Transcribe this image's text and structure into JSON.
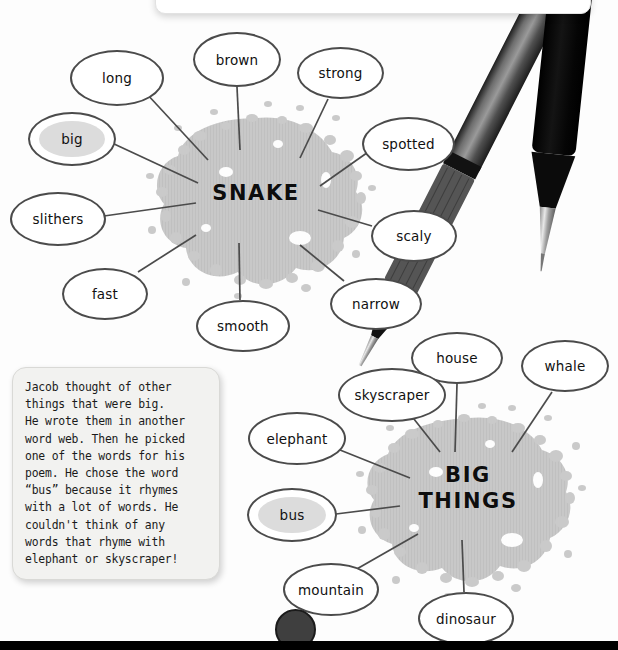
{
  "page": {
    "background_color": "#fdfdfd"
  },
  "top_panel": {
    "name": "cut-off-panel",
    "color": "#ffffff"
  },
  "colors": {
    "bubble_stroke": "#4b4b4b",
    "bubble_fill": "#ffffff",
    "highlight_fill": "#dcdcdc",
    "splatter_gray": "#c3c3c3",
    "splatter_light": "#d4d4d4",
    "connector": "#4b4b4b",
    "note_fill": "#f2f2f0",
    "bar_black": "#000000",
    "knob_gray": "#3f3f3f",
    "pen_dark": "#2b2b2b",
    "pen_black": "#0a0a0a"
  },
  "webs": [
    {
      "id": "snake-web",
      "center_label": "SNAKE",
      "center": {
        "x": 256,
        "y": 197
      },
      "nodes": [
        {
          "id": "long",
          "label": "long",
          "x": 70,
          "y": 50,
          "w": 94,
          "h": 56,
          "highlight": false
        },
        {
          "id": "brown",
          "label": "brown",
          "x": 193,
          "y": 32,
          "w": 88,
          "h": 55,
          "highlight": false
        },
        {
          "id": "strong",
          "label": "strong",
          "x": 297,
          "y": 47,
          "w": 87,
          "h": 52,
          "highlight": false
        },
        {
          "id": "spotted",
          "label": "spotted",
          "x": 362,
          "y": 117,
          "w": 93,
          "h": 54,
          "highlight": false
        },
        {
          "id": "scaly",
          "label": "scaly",
          "x": 371,
          "y": 210,
          "w": 86,
          "h": 52,
          "highlight": false
        },
        {
          "id": "narrow",
          "label": "narrow",
          "x": 330,
          "y": 278,
          "w": 92,
          "h": 52,
          "highlight": false
        },
        {
          "id": "smooth",
          "label": "smooth",
          "x": 196,
          "y": 300,
          "w": 94,
          "h": 52,
          "highlight": false
        },
        {
          "id": "fast",
          "label": "fast",
          "x": 62,
          "y": 268,
          "w": 86,
          "h": 52,
          "highlight": false
        },
        {
          "id": "slithers",
          "label": "slithers",
          "x": 10,
          "y": 192,
          "w": 96,
          "h": 54,
          "highlight": false
        },
        {
          "id": "big",
          "label": "big",
          "x": 28,
          "y": 112,
          "w": 88,
          "h": 54,
          "highlight": true
        }
      ]
    },
    {
      "id": "big-things-web",
      "center_label_line1": "BIG",
      "center_label_line2": "THINGS",
      "center": {
        "x": 468,
        "y": 491
      },
      "nodes": [
        {
          "id": "house",
          "label": "house",
          "x": 411,
          "y": 332,
          "w": 92,
          "h": 52,
          "highlight": false
        },
        {
          "id": "whale",
          "label": "whale",
          "x": 521,
          "y": 340,
          "w": 88,
          "h": 52,
          "highlight": false
        },
        {
          "id": "skyscraper",
          "label": "skyscraper",
          "x": 338,
          "y": 368,
          "w": 108,
          "h": 54,
          "highlight": false
        },
        {
          "id": "elephant",
          "label": "elephant",
          "x": 248,
          "y": 412,
          "w": 98,
          "h": 53,
          "highlight": false
        },
        {
          "id": "bus",
          "label": "bus",
          "x": 247,
          "y": 488,
          "w": 90,
          "h": 54,
          "highlight": true
        },
        {
          "id": "mountain",
          "label": "mountain",
          "x": 283,
          "y": 563,
          "w": 96,
          "h": 53,
          "highlight": false
        },
        {
          "id": "dinosaur",
          "label": "dinosaur",
          "x": 418,
          "y": 592,
          "w": 96,
          "h": 53,
          "highlight": false
        }
      ]
    }
  ],
  "note": {
    "id": "side-note",
    "text": "Jacob thought of other\nthings that were big.\nHe wrote them in another\nword web. Then he picked\none of the words for his\npoem. He chose the word\n“bus” because it rhymes\nwith a lot of words. He\ncouldn't think of any\nwords that rhyme with\nelephant or skyscraper!"
  },
  "bottom": {
    "bar_name": "bottom-black-bar",
    "knob_name": "bottom-circle-knob"
  },
  "pens": [
    {
      "id": "pen-gray",
      "name": "mechanical-pencil"
    },
    {
      "id": "pen-black",
      "name": "black-pen"
    }
  ]
}
